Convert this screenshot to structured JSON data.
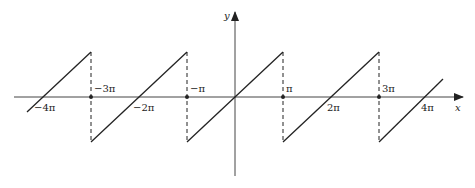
{
  "diagram": {
    "axes": {
      "x_label": "x",
      "y_label": "y"
    },
    "ticks": [
      {
        "key": "m4pi",
        "label": "−4π",
        "pos": -4
      },
      {
        "key": "m3pi",
        "label": "−3π",
        "pos": -3
      },
      {
        "key": "m2pi",
        "label": "−2π",
        "pos": -2
      },
      {
        "key": "mpi",
        "label": "−π",
        "pos": -1
      },
      {
        "key": "pi",
        "label": "π",
        "pos": 1
      },
      {
        "key": "2pi",
        "label": "2π",
        "pos": 2
      },
      {
        "key": "3pi",
        "label": "3π",
        "pos": 3
      },
      {
        "key": "4pi",
        "label": "4π",
        "pos": 4
      }
    ],
    "labels": {
      "m4pi": "−4π",
      "m3pi": "−3π",
      "m2pi": "−2π",
      "mpi": "−π",
      "pi": "π",
      "two_pi": "2π",
      "three_pi": "3π",
      "four_pi": "4π"
    },
    "discontinuities": [
      "-3π",
      "-π",
      "π",
      "3π"
    ],
    "line_color": "#222222",
    "dash_style": "dashed vertical jump lines"
  }
}
